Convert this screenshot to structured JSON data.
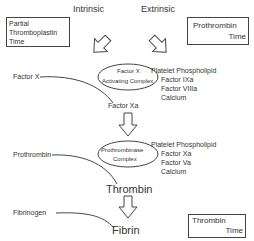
{
  "diagram": {
    "type": "coagulation-cascade",
    "pathways": {
      "intrinsic": "Intrinsic",
      "extrinsic": "Extrinsic"
    },
    "tests": {
      "ptt": [
        "Partial",
        "Thromboplastin",
        "Time"
      ],
      "pt": [
        "Prothrombin",
        "Time"
      ],
      "tt": [
        "Thrombin",
        "Time"
      ]
    },
    "complexes": {
      "factor_x_activating": {
        "label": [
          "Factor X",
          "Activating Complex"
        ],
        "components": [
          "Platelet Phospholipid",
          "Factor IXa",
          "Factor VIIIa",
          "Calcium"
        ]
      },
      "prothrombinase": {
        "label": [
          "Prothrombinase",
          "Complex"
        ],
        "components": [
          "Platelet Phospholipid",
          "Factor Xa",
          "Factor Va",
          "Calcium"
        ]
      }
    },
    "substrates": {
      "factor_x": "Factor X",
      "prothrombin": "Prothrombin",
      "fibrinogen": "Fibrinogen"
    },
    "products": {
      "factor_xa": "Factor Xa",
      "thrombin": "Thrombin",
      "fibrin": "Fibrin"
    }
  }
}
